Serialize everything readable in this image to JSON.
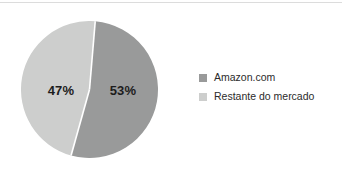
{
  "chart_data": {
    "type": "pie",
    "title": "",
    "subtitle": "",
    "xlabel": "",
    "ylabel": "",
    "grid": false,
    "legend_position": "right",
    "categories": [
      "Amazon.com",
      "Restante do mercado"
    ],
    "values": [
      53,
      47
    ],
    "value_unit": "%",
    "slices": [
      {
        "label": "Amazon.com",
        "value": 53,
        "value_label": "53%",
        "color": "#999a9a",
        "position": "right"
      },
      {
        "label": "Restante do mercado",
        "value": 47,
        "value_label": "47%",
        "color": "#cdcecd",
        "position": "left"
      }
    ]
  },
  "chart": {
    "slice_labels": {
      "left": "47%",
      "right": "53%"
    },
    "colors": {
      "amazon": "#999a9a",
      "rest": "#cdcecd",
      "separator": "#ffffff",
      "label_text": "#1d1d1d",
      "legend_text": "#2b2b2b",
      "background": "#ffffff",
      "border": "#dcdcdc"
    }
  },
  "legend": {
    "items": [
      {
        "label": "Amazon.com",
        "color": "#999a9a"
      },
      {
        "label": "Restante do mercado",
        "color": "#cdcecd"
      }
    ]
  }
}
